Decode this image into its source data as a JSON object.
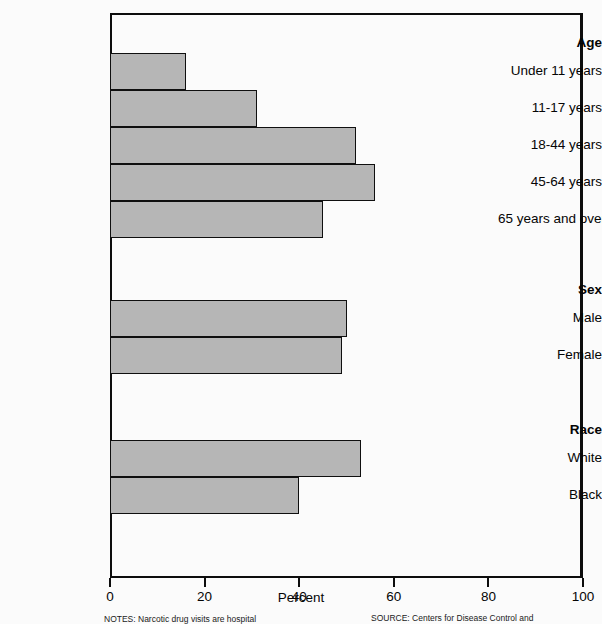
{
  "chart_data": {
    "type": "bar",
    "orientation": "horizontal",
    "title": "",
    "xlabel": "Percent",
    "ylabel": "",
    "xlim": [
      0,
      100
    ],
    "xticks": [
      0,
      20,
      40,
      60,
      80,
      100
    ],
    "xticklabels": [
      "0",
      "20",
      "40",
      "60",
      "80",
      "100"
    ],
    "grid": false,
    "legend": false,
    "bar_color": "#b6b6b6",
    "bar_edge_color": "#0f0f0f",
    "groups": [
      {
        "name": "Age",
        "categories": [
          "Under 11 years",
          "11-17 years",
          "18-44 years",
          "45-64 years",
          "65 years and over"
        ],
        "values": [
          16,
          31,
          52,
          56,
          45
        ]
      },
      {
        "name": "Sex",
        "categories": [
          "Male",
          "Female"
        ],
        "values": [
          50,
          49
        ]
      },
      {
        "name": "Race",
        "categories": [
          "White",
          "Black"
        ],
        "values": [
          53,
          40
        ]
      }
    ],
    "categories": [
      "Under 11 years",
      "11-17 years",
      "18-44 years",
      "45-64 years",
      "65 years and over",
      "Male",
      "Female",
      "White",
      "Black"
    ],
    "values": [
      16,
      31,
      52,
      56,
      45,
      50,
      49,
      53,
      40
    ]
  },
  "axis": {
    "x_title": "Percent",
    "ticks": [
      {
        "label": "0",
        "value": 0
      },
      {
        "label": "20",
        "value": 20
      },
      {
        "label": "40",
        "value": 40
      },
      {
        "label": "60",
        "value": 60
      },
      {
        "label": "80",
        "value": 80
      },
      {
        "label": "100",
        "value": 100
      }
    ]
  },
  "ylabels": [
    {
      "text": "Age",
      "group": true
    },
    {
      "text": "Under 11 years",
      "group": false
    },
    {
      "text": "11-17 years",
      "group": false
    },
    {
      "text": "18-44 years",
      "group": false
    },
    {
      "text": "45-64 years",
      "group": false
    },
    {
      "text": "65 years and over",
      "group": false
    },
    {
      "text": "Sex",
      "group": true
    },
    {
      "text": "Male",
      "group": false
    },
    {
      "text": "Female",
      "group": false
    },
    {
      "text": "Race",
      "group": true
    },
    {
      "text": "White",
      "group": false
    },
    {
      "text": "Black",
      "group": false
    }
  ],
  "footnotes": {
    "notes": "NOTES: Narcotic drug visits are hospital",
    "source": "SOURCE: Centers for Disease Control and"
  }
}
